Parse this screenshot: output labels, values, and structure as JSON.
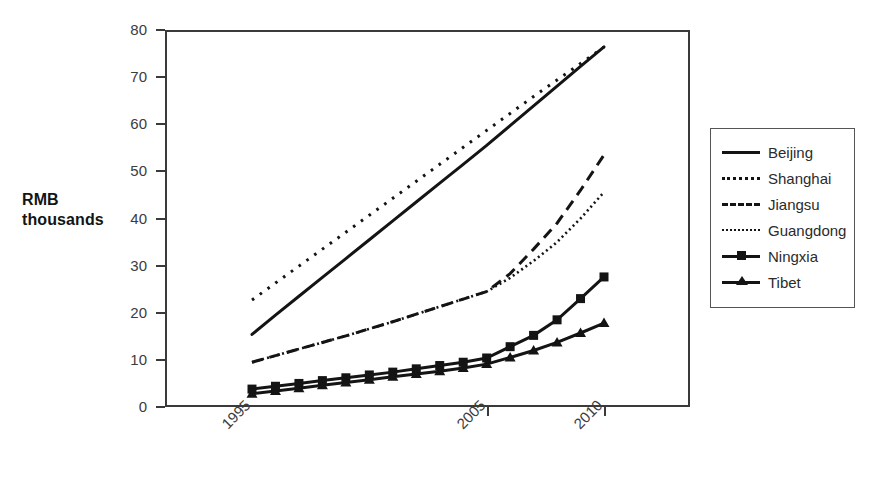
{
  "axis": {
    "ylabel_line1": "RMB",
    "ylabel_line2": "thousands",
    "y_ticks": [
      "0",
      "10",
      "20",
      "30",
      "40",
      "50",
      "60",
      "70",
      "80"
    ],
    "x_ticks": [
      "1995",
      "2005",
      "2010"
    ]
  },
  "legend": {
    "items": [
      {
        "label": "Beijing",
        "style": "solid"
      },
      {
        "label": "Shanghai",
        "style": "dotted-coarse"
      },
      {
        "label": "Jiangsu",
        "style": "dashed"
      },
      {
        "label": "Guangdong",
        "style": "dotted-fine"
      },
      {
        "label": "Ningxia",
        "style": "solid-square"
      },
      {
        "label": "Tibet",
        "style": "solid-triangle"
      }
    ]
  },
  "colors": {
    "line": "#141414",
    "axis": "#3a3a3a",
    "text": "#2b2b2b",
    "background": "#ffffff"
  },
  "chart_data": {
    "type": "line",
    "title": "",
    "xlabel": "",
    "ylabel": "RMB thousands",
    "xlim": [
      1995,
      2010
    ],
    "ylim": [
      0,
      80
    ],
    "grid": false,
    "legend_position": "right",
    "x": [
      1995,
      1996,
      1997,
      1998,
      1999,
      2000,
      2001,
      2002,
      2003,
      2004,
      2005,
      2006,
      2007,
      2008,
      2009,
      2010
    ],
    "xtick_values": [
      1995,
      2005,
      2010
    ],
    "ytick_values": [
      0,
      10,
      20,
      30,
      40,
      50,
      60,
      70,
      80
    ],
    "series": [
      {
        "name": "Beijing",
        "style": "solid",
        "marker": "none",
        "values": [
          15.4,
          19.5,
          23.5,
          27.5,
          31.5,
          35.5,
          39.5,
          43.5,
          47.5,
          51.5,
          55.5,
          59.7,
          63.9,
          68.1,
          72.3,
          76.4
        ]
      },
      {
        "name": "Shanghai",
        "style": "dotted-coarse",
        "marker": "none",
        "values": [
          22.7,
          26.3,
          29.9,
          33.5,
          37.1,
          40.7,
          44.3,
          47.9,
          51.5,
          55.1,
          58.7,
          62.3,
          65.9,
          69.4,
          72.9,
          76.4
        ]
      },
      {
        "name": "Jiangsu",
        "style": "dashed",
        "marker": "none",
        "values": [
          9.5,
          10.9,
          12.3,
          13.7,
          15.1,
          16.6,
          18.1,
          19.7,
          21.3,
          22.9,
          24.5,
          28.3,
          33.5,
          39.0,
          46.0,
          53.5
        ]
      },
      {
        "name": "Guangdong",
        "style": "dotted-fine",
        "marker": "none",
        "values": [
          9.5,
          10.9,
          12.3,
          13.7,
          15.1,
          16.6,
          18.1,
          19.7,
          21.3,
          22.9,
          24.5,
          27.4,
          31.0,
          35.0,
          40.0,
          45.6
        ]
      },
      {
        "name": "Ningxia",
        "style": "solid",
        "marker": "square",
        "values": [
          3.8,
          4.4,
          5.0,
          5.6,
          6.2,
          6.8,
          7.4,
          8.1,
          8.8,
          9.5,
          10.4,
          12.8,
          15.2,
          18.5,
          23.0,
          27.6
        ]
      },
      {
        "name": "Tibet",
        "style": "solid",
        "marker": "triangle",
        "values": [
          2.8,
          3.4,
          4.0,
          4.6,
          5.2,
          5.8,
          6.4,
          7.0,
          7.6,
          8.3,
          9.1,
          10.5,
          12.0,
          13.7,
          15.7,
          17.8
        ]
      }
    ]
  }
}
